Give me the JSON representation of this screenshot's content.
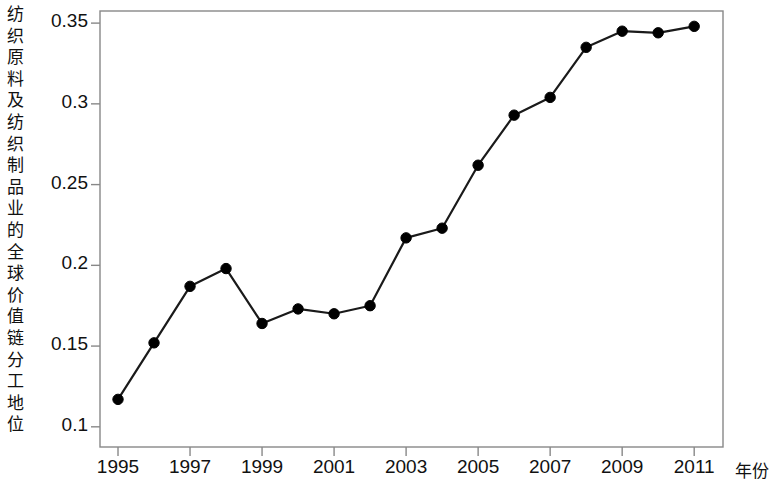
{
  "chart_data": {
    "type": "line",
    "title": "",
    "ylabel": "纺织原料及纺织制品业的全球价值链分工地位",
    "xlabel": "年份",
    "x": [
      1995,
      1996,
      1997,
      1998,
      1999,
      2000,
      2001,
      2002,
      2003,
      2004,
      2005,
      2006,
      2007,
      2008,
      2009,
      2010,
      2011
    ],
    "values": [
      0.117,
      0.152,
      0.187,
      0.198,
      0.164,
      0.173,
      0.17,
      0.175,
      0.217,
      0.223,
      0.262,
      0.293,
      0.304,
      0.335,
      0.345,
      0.344,
      0.348
    ],
    "series": [
      {
        "name": "纺织原料及纺织制品业的全球价值链分工地位",
        "values": [
          0.117,
          0.152,
          0.187,
          0.198,
          0.164,
          0.173,
          0.17,
          0.175,
          0.217,
          0.223,
          0.262,
          0.293,
          0.304,
          0.335,
          0.345,
          0.344,
          0.348
        ]
      }
    ],
    "xtick_labels": [
      "1995",
      "1997",
      "1999",
      "2001",
      "2003",
      "2005",
      "2007",
      "2009",
      "2011"
    ],
    "xtick_values": [
      1995,
      1997,
      1999,
      2001,
      2003,
      2005,
      2007,
      2009,
      2011
    ],
    "ytick_labels": [
      "0.1",
      "0.15",
      "0.2",
      "0.25",
      "0.3",
      "0.35"
    ],
    "ytick_values": [
      0.1,
      0.15,
      0.2,
      0.25,
      0.3,
      0.35
    ],
    "xlim": [
      1994.5,
      2011.8
    ],
    "ylim": [
      0.0875,
      0.3575
    ],
    "grid": false,
    "legend": false,
    "marker": "filled-circle",
    "line_color": "#1a1a1a",
    "marker_color": "#000000",
    "background_color": "#ffffff",
    "frame_color": "#888888"
  },
  "ylabel_chars": [
    "纺",
    "织",
    "原",
    "料",
    "及",
    "纺",
    "织",
    "制",
    "品",
    "业",
    "的",
    "全",
    "球",
    "价",
    "值",
    "链",
    "分",
    "工",
    "地",
    "位"
  ]
}
